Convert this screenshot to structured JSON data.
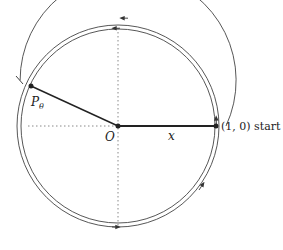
{
  "diagram": {
    "labels": {
      "point": "P",
      "point_subscript": "θ",
      "origin": "O",
      "x_label": "x",
      "start_label": "(1, 0) start"
    },
    "colors": {
      "stroke": "#333333",
      "axis": "#888888",
      "radius_line": "#222222"
    },
    "geometry": {
      "center": [
        118,
        126
      ],
      "radius": 98,
      "theta_deg": 155
    }
  }
}
